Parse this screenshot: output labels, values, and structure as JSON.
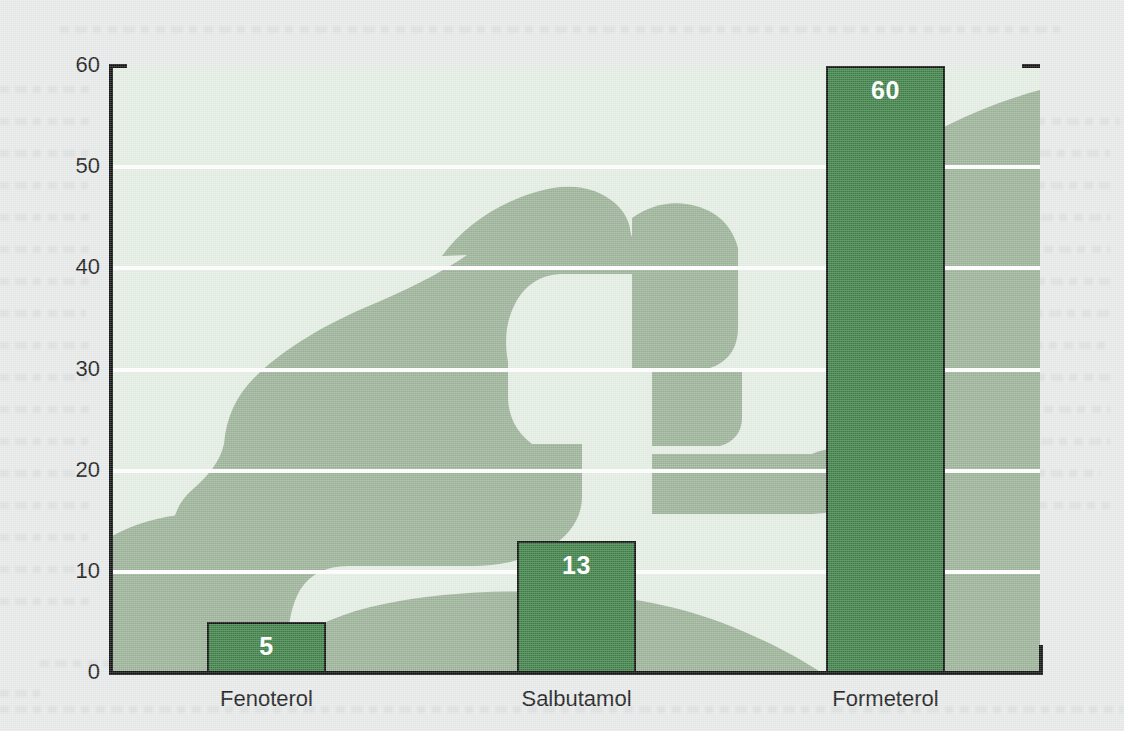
{
  "chart_data": {
    "type": "bar",
    "title": "",
    "subtitle": "",
    "xlabel": "",
    "ylabel": "",
    "categories": [
      "Fenoterol",
      "Salbutamol",
      "Formeterol"
    ],
    "values": [
      5,
      13,
      60
    ],
    "value_labels": [
      "5",
      "13",
      "60"
    ],
    "ylim": [
      0,
      60
    ],
    "yticks": [
      0,
      10,
      20,
      30,
      40,
      50,
      60
    ],
    "ytick_labels": [
      "0",
      "10",
      "20",
      "30",
      "40",
      "50",
      "60"
    ],
    "grid": "horizontal",
    "gridline_color": "#fdfefd",
    "legend": null,
    "annotations": []
  },
  "style": {
    "page_background": "#e8eaea",
    "plot_background": "#e4eee3",
    "silhouette_color": "#9cb39a",
    "bar_color": "#3e8048",
    "bar_outline_color": "#111111",
    "axis_color": "#111111",
    "value_label_color": "#ffffff",
    "tick_label_color": "#1b1b1b"
  },
  "artwork": {
    "name": "inhaler-silhouette",
    "description": "Silhouette of a hand holding a metered-dose inhaler to a face in profile"
  },
  "axes": {
    "y_axis_name": "y-axis",
    "x_axis_name": "x-axis"
  }
}
